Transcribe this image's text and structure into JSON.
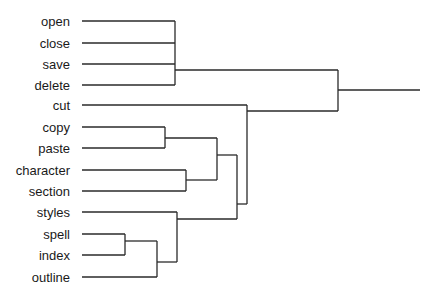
{
  "diagram": {
    "type": "dendrogram",
    "orientation": "leaves-left-root-right",
    "colors": {
      "line": "#2a2a2a",
      "text": "#1a1a1a",
      "background": "#ffffff"
    },
    "label_right_x": 70,
    "leaf_start_x": 82,
    "leaves": [
      {
        "label": "open",
        "y": 21
      },
      {
        "label": "close",
        "y": 43
      },
      {
        "label": "save",
        "y": 64
      },
      {
        "label": "delete",
        "y": 85
      },
      {
        "label": "cut",
        "y": 105
      },
      {
        "label": "copy",
        "y": 127
      },
      {
        "label": "paste",
        "y": 148
      },
      {
        "label": "character",
        "y": 170
      },
      {
        "label": "section",
        "y": 191
      },
      {
        "label": "styles",
        "y": 212
      },
      {
        "label": "spell",
        "y": 234
      },
      {
        "label": "index",
        "y": 255
      },
      {
        "label": "outline",
        "y": 277
      }
    ],
    "clusters": [
      {
        "name": "file-ops",
        "members": [
          "open",
          "close",
          "save",
          "delete"
        ],
        "join_x": 175,
        "y_top": 21,
        "y_bottom": 85,
        "out_y": 70
      },
      {
        "name": "copy-paste",
        "members": [
          "copy",
          "paste"
        ],
        "join_x": 165,
        "y_top": 127,
        "y_bottom": 148,
        "out_y": 138
      },
      {
        "name": "character-section",
        "members": [
          "character",
          "section"
        ],
        "join_x": 186,
        "y_top": 170,
        "y_bottom": 191,
        "out_y": 180
      },
      {
        "name": "spell-index",
        "members": [
          "spell",
          "index"
        ],
        "join_x": 125,
        "y_top": 234,
        "y_bottom": 255,
        "out_y": 241
      },
      {
        "name": "spell-index-outline",
        "members": [
          "spell-index",
          "outline"
        ],
        "join_x": 157,
        "y_top": 241,
        "y_bottom": 277,
        "out_y": 262
      },
      {
        "name": "styles-group",
        "members": [
          "styles",
          "spell-index-outline"
        ],
        "join_x": 177,
        "y_top": 212,
        "y_bottom": 262,
        "out_y": 219
      },
      {
        "name": "edit-format",
        "members": [
          "copy-paste",
          "character-section"
        ],
        "join_x": 217,
        "y_top": 138,
        "y_bottom": 180,
        "out_y": 155
      },
      {
        "name": "edit-format-styles",
        "members": [
          "edit-format",
          "styles-group"
        ],
        "join_x": 237,
        "y_top": 155,
        "y_bottom": 219,
        "out_y": 204
      },
      {
        "name": "cut-group",
        "members": [
          "cut",
          "edit-format-styles"
        ],
        "join_x": 247,
        "y_top": 105,
        "y_bottom": 204,
        "out_y": 111
      },
      {
        "name": "root",
        "members": [
          "file-ops",
          "cut-group"
        ],
        "join_x": 338,
        "y_top": 70,
        "y_bottom": 111,
        "out_y": 90
      }
    ],
    "root_line_end_x": 420
  }
}
